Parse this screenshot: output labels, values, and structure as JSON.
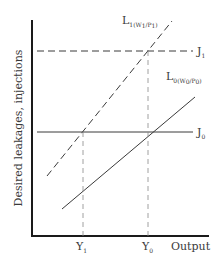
{
  "diagram": {
    "y_axis_label": "Desired leakages, injections",
    "x_axis_label": "Output",
    "lines": {
      "J1": {
        "main": "J",
        "sub": "1",
        "style": "dashed"
      },
      "J0": {
        "main": "J",
        "sub": "0",
        "style": "solid"
      },
      "L1": {
        "main": "L",
        "sub": "1(W",
        "sub2": "1",
        "mid": "/P",
        "sub3": "1",
        "close": ")",
        "style": "dashed"
      },
      "L0": {
        "main": "L",
        "sub": "0(W",
        "sub2": "0",
        "mid": "/P",
        "sub3": "0",
        "close": ")",
        "style": "solid"
      }
    },
    "x_ticks": [
      {
        "main": "Y",
        "sub": "1"
      },
      {
        "main": "Y",
        "sub": "0"
      }
    ],
    "colors": {
      "ink": "#3a3a3a",
      "axis": "#1a1a1a",
      "background": "#ffffff"
    }
  }
}
